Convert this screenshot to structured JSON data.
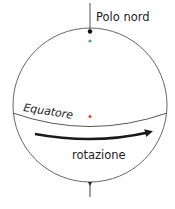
{
  "diagram": {
    "labels": {
      "north_pole": "Polo nord",
      "equator": "Equatore",
      "rotation": "rotazione"
    },
    "points": [
      {
        "name": "north-pole-point",
        "color": "#111111"
      },
      {
        "name": "near-pole-point",
        "color": "#4caf50"
      },
      {
        "name": "equator-point",
        "color": "#e8502a"
      }
    ],
    "colors": {
      "outline": "#555555",
      "arrow": "#1a1a1a",
      "text": "#222222"
    }
  }
}
